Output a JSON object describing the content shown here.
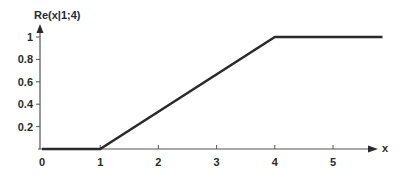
{
  "chart_data": {
    "type": "line",
    "title": "",
    "xlabel": "x",
    "ylabel": "Re(x|1;4)",
    "xlim": [
      0,
      5.85
    ],
    "ylim": [
      0,
      1
    ],
    "x_ticks": [
      0,
      1,
      2,
      3,
      4,
      5
    ],
    "x_tick_labels": [
      "0",
      "1",
      "2",
      "3",
      "4",
      "5"
    ],
    "y_ticks": [
      0.2,
      0.4,
      0.6,
      0.8,
      1
    ],
    "y_tick_labels": [
      "0.2",
      "0.4",
      "0.6",
      "0.8",
      "1"
    ],
    "grid": false,
    "legend": null,
    "series": [
      {
        "name": "Re(x|1;4)",
        "x": [
          0,
          1,
          4,
          5.85
        ],
        "y": [
          0,
          0,
          1,
          1
        ]
      }
    ]
  },
  "colors": {
    "axis": "#555555",
    "line": "#2a2a2a",
    "text": "#2a2a2a"
  }
}
